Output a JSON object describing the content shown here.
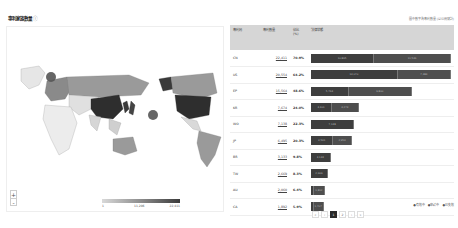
{
  "header": {
    "title": "專利家族數量",
    "info_icon": "info-icon",
    "source_note": "圖中數字為專利數量 (以公開號計)"
  },
  "map": {
    "zoom_in_label": "+",
    "zoom_out_label": "-",
    "legend": {
      "min": "1",
      "mid": "11,206",
      "max": "22,411"
    },
    "bubbles": [
      {
        "region": "Europe",
        "label": "EP"
      },
      {
        "region": "Pacific",
        "label": "WO"
      }
    ]
  },
  "table": {
    "headers": [
      "專利局",
      "專利數量",
      "佔比 (%)",
      "法律狀態"
    ],
    "rows": [
      {
        "code": "CN",
        "count": "22,411",
        "pct": "70.9%",
        "bars": [
          {
            "w": 45,
            "t": "10,865"
          },
          {
            "w": 55,
            "t": "11,546"
          }
        ]
      },
      {
        "code": "US",
        "count": "20,554",
        "pct": "64.2%",
        "bars": [
          {
            "w": 62,
            "t": "13,070"
          },
          {
            "w": 38,
            "t": "7,484"
          }
        ]
      },
      {
        "code": "EP",
        "count": "15,564",
        "pct": "48.6%",
        "bars": [
          {
            "w": 27,
            "t": "5,764"
          },
          {
            "w": 45,
            "t": "9,800"
          }
        ]
      },
      {
        "code": "KR",
        "count": "7,674",
        "pct": "24.0%",
        "bars": [
          {
            "w": 15,
            "t": "3,401"
          },
          {
            "w": 19,
            "t": "4,273"
          }
        ]
      },
      {
        "code": "WO",
        "count": "7,138",
        "pct": "22.3%",
        "bars": [
          {
            "w": 31,
            "t": "7,138"
          }
        ]
      },
      {
        "code": "JP",
        "count": "6,495",
        "pct": "20.3%",
        "bars": [
          {
            "w": 16,
            "t": "3,541"
          },
          {
            "w": 13,
            "t": "2,954"
          }
        ]
      },
      {
        "code": "BR",
        "count": "3,133",
        "pct": "9.8%",
        "bars": [
          {
            "w": 14,
            "t": "3,133"
          }
        ]
      },
      {
        "code": "TW",
        "count": "2,669",
        "pct": "8.3%",
        "bars": [
          {
            "w": 12,
            "t": "2,669"
          }
        ]
      },
      {
        "code": "AU",
        "count": "2,060",
        "pct": "6.4%",
        "bars": [
          {
            "w": 2,
            "t": ""
          },
          {
            "w": 8,
            "t": "1,812"
          }
        ]
      },
      {
        "code": "CA",
        "count": "1,892",
        "pct": "5.9%",
        "bars": [
          {
            "w": 2,
            "t": ""
          },
          {
            "w": 7,
            "t": "1,707"
          }
        ]
      }
    ],
    "status_legend": [
      "●有效中",
      "●申請中",
      "●已失效"
    ]
  },
  "pagination": {
    "prev2": "«",
    "prev": "‹",
    "page1": "1",
    "page2": "2",
    "next": "›",
    "next2": "»"
  }
}
